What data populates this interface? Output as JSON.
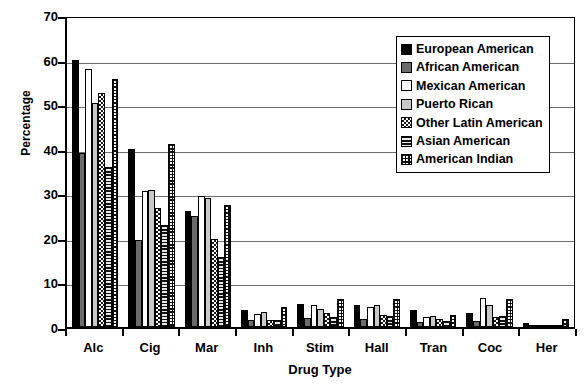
{
  "chart_data": {
    "type": "bar",
    "title": "",
    "xlabel": "Drug Type",
    "ylabel": "Percentage",
    "ylim": [
      0,
      70
    ],
    "ytick_step": 10,
    "yticks": [
      0,
      10,
      20,
      30,
      40,
      50,
      60,
      70
    ],
    "grid": "horizontal",
    "legend_position": "top-right-inside",
    "categories": [
      "Alc",
      "Cig",
      "Mar",
      "Inh",
      "Stim",
      "Hall",
      "Tran",
      "Coc",
      "Her"
    ],
    "series": [
      {
        "name": "European American",
        "pattern": "solid-black",
        "color": "#000000",
        "values": [
          60.0,
          40.0,
          26.0,
          3.8,
          5.2,
          5.0,
          3.8,
          3.2,
          0.9
        ]
      },
      {
        "name": "African American",
        "pattern": "solid-darkgray",
        "color": "#6b6b6b",
        "values": [
          39.0,
          19.6,
          25.0,
          1.6,
          2.0,
          1.8,
          1.2,
          1.4,
          0.5
        ]
      },
      {
        "name": "Mexican American",
        "pattern": "solid-white",
        "color": "#ffffff",
        "values": [
          58.0,
          30.6,
          29.5,
          3.0,
          5.0,
          4.6,
          2.2,
          6.5,
          0.4
        ]
      },
      {
        "name": "Puerto Rican",
        "pattern": "solid-lightgray",
        "color": "#c9c9c9",
        "values": [
          50.2,
          30.8,
          29.0,
          3.4,
          4.0,
          5.0,
          2.4,
          5.0,
          0.5
        ]
      },
      {
        "name": "Other Latin American",
        "pattern": "checkerboard",
        "color": "#ffffff",
        "values": [
          52.4,
          26.6,
          19.8,
          1.6,
          3.2,
          2.6,
          1.8,
          2.2,
          0.3
        ]
      },
      {
        "name": "Asian American",
        "pattern": "horizontal-lines",
        "color": "#d0d0d0",
        "values": [
          36.0,
          23.0,
          15.6,
          1.6,
          2.2,
          2.4,
          1.4,
          2.4,
          0.4
        ]
      },
      {
        "name": "American Indian",
        "pattern": "grid-hatch",
        "color": "#ffffff",
        "values": [
          55.6,
          41.0,
          27.4,
          4.6,
          6.2,
          6.2,
          2.6,
          6.2,
          1.9
        ]
      }
    ]
  },
  "axes": {
    "y_title": "Percentage",
    "x_title": "Drug Type",
    "y_tick_labels": [
      "70",
      "60",
      "50",
      "40",
      "30",
      "20",
      "10",
      "0"
    ],
    "x_tick_labels": [
      "Alc",
      "Cig",
      "Mar",
      "Inh",
      "Stim",
      "Hall",
      "Tran",
      "Coc",
      "Her"
    ]
  },
  "legend": {
    "items": [
      {
        "label": "European American"
      },
      {
        "label": "African American"
      },
      {
        "label": "Mexican American"
      },
      {
        "label": "Puerto Rican"
      },
      {
        "label": "Other Latin American"
      },
      {
        "label": "Asian American"
      },
      {
        "label": "American Indian"
      }
    ]
  }
}
